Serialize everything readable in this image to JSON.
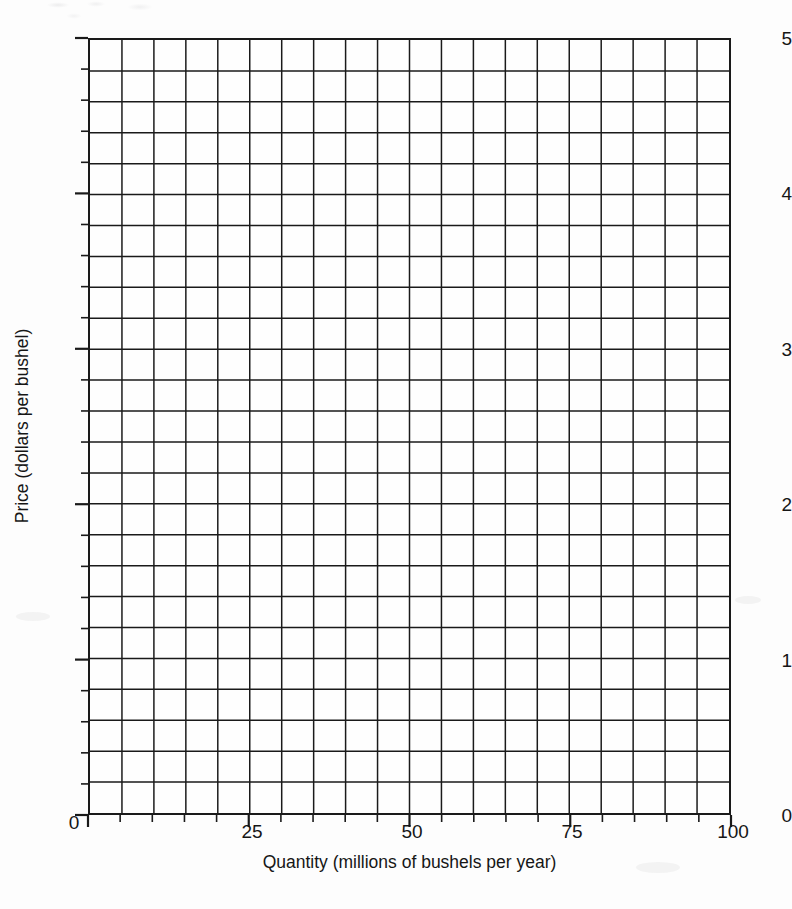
{
  "figure": {
    "background_color": "#fdfdfd",
    "ink_color": "#1a1a1a",
    "plot_background_color": "#fefefe"
  },
  "axes": {
    "x": {
      "title": "Quantity (millions of bushels per year)",
      "tick_labels": [
        "0",
        "25",
        "50",
        "75",
        "100"
      ],
      "tick_values": [
        0,
        25,
        50,
        75,
        100
      ],
      "min": 0,
      "max": 100,
      "grid_step": 5,
      "grid_line_count": 21
    },
    "y": {
      "title": "Price (dollars per bushel)",
      "tick_labels": [
        "0",
        "1",
        "2",
        "3",
        "4",
        "5"
      ],
      "tick_values": [
        0,
        1,
        2,
        3,
        4,
        5
      ],
      "min": 0,
      "max": 5,
      "grid_step": 0.2,
      "grid_line_count": 26
    }
  },
  "chart_data": {
    "type": "line",
    "title": "",
    "subtitle": "",
    "xlabel": "Quantity (millions of bushels per year)",
    "ylabel": "Price (dollars per bushel)",
    "xlim": [
      0,
      100
    ],
    "ylim": [
      0,
      5
    ],
    "xticks": [
      0,
      25,
      50,
      75,
      100
    ],
    "yticks": [
      0,
      1,
      2,
      3,
      4,
      5
    ],
    "xtick_labels": [
      "0",
      "25",
      "50",
      "75",
      "100"
    ],
    "ytick_labels": [
      "0",
      "1",
      "2",
      "3",
      "4",
      "5"
    ],
    "x_minor_step": 5,
    "y_minor_step": 0.2,
    "grid": true,
    "grid_style": "full rectangular mesh, uniform thin black lines, 20 columns by 25 rows",
    "legend": false,
    "legend_position": "none",
    "annotations": [],
    "series": [],
    "note": "Blank worksheet grid for plotting supply and demand curves; no data plotted."
  }
}
